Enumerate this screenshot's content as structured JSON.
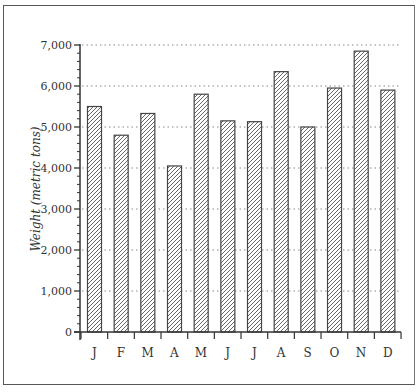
{
  "chart_data": {
    "type": "bar",
    "title": "",
    "xlabel": "",
    "ylabel": "Weight (metric tons)",
    "categories": [
      "J",
      "F",
      "M",
      "A",
      "M",
      "J",
      "J",
      "A",
      "S",
      "O",
      "N",
      "D"
    ],
    "values": [
      5500,
      4800,
      5330,
      4050,
      5800,
      5150,
      5130,
      6350,
      5000,
      5950,
      6850,
      5900
    ],
    "ylim": [
      0,
      7000
    ],
    "yticks": [
      0,
      1000,
      2000,
      3000,
      4000,
      5000,
      6000,
      7000
    ],
    "ytick_labels": [
      "0",
      "1,000",
      "2,000",
      "3,000",
      "4,000",
      "5,000",
      "6,000",
      "7,000"
    ],
    "minor_ticks_per_interval": 4,
    "grid": "horizontal dotted at major ticks",
    "bar_fill": "diagonal hatch",
    "legend": null
  },
  "style": {
    "axis_color": "#333333",
    "grid_color": "#888888",
    "bar_edge": "#444444",
    "hatch_color": "#555555",
    "frame_color": "#555555"
  }
}
